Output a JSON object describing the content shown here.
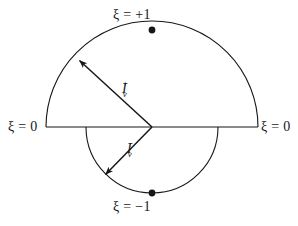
{
  "figure": {
    "type": "geometric-diagram",
    "background_color": "#ffffff",
    "stroke_color": "#171717"
  },
  "labels": {
    "top": "ξ = +1",
    "bottom": "ξ = −1",
    "left": "ξ = 0",
    "right": "ξ = 0"
  },
  "arrows": {
    "upper": {
      "base": "I",
      "subscript": "v",
      "superscript": "+"
    },
    "lower": {
      "base": "I",
      "subscript": "v",
      "superscript": "−"
    }
  },
  "geometry": {
    "center_x": 152,
    "center_y": 127,
    "upper_radius": 106,
    "lower_radius": 66,
    "upper_arrow_tip_x": 77,
    "upper_arrow_tip_y": 58,
    "lower_arrow_tip_x": 103,
    "lower_arrow_tip_y": 177,
    "top_dot_x": 152,
    "top_dot_y": 30,
    "bottom_dot_x": 152,
    "bottom_dot_y": 193,
    "line_left_x": 46,
    "line_right_x": 258,
    "dot_radius": 3.4
  }
}
